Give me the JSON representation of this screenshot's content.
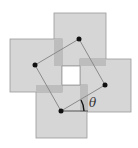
{
  "diagram": {
    "colors": {
      "background": "#ffffff",
      "square_fill": "#d6d6d6",
      "square_stroke": "#9a9a9a",
      "overlap_fill": "#bdbdbd",
      "line": "#8a8a8a",
      "dot": "#111111",
      "hole": "#ffffff"
    },
    "squares": [
      {
        "name": "top",
        "x": 54,
        "y": 13,
        "w": 52,
        "h": 53
      },
      {
        "name": "right",
        "x": 80,
        "y": 59,
        "w": 51,
        "h": 53
      },
      {
        "name": "bottom",
        "x": 36,
        "y": 85,
        "w": 51,
        "h": 53
      },
      {
        "name": "left",
        "x": 10,
        "y": 39,
        "w": 52,
        "h": 53
      }
    ],
    "centers": [
      {
        "name": "top",
        "x": 79,
        "y": 39
      },
      {
        "name": "right",
        "x": 105,
        "y": 85
      },
      {
        "name": "bottom",
        "x": 61,
        "y": 111
      },
      {
        "name": "left",
        "x": 35,
        "y": 65
      }
    ],
    "angle_label": "θ"
  }
}
